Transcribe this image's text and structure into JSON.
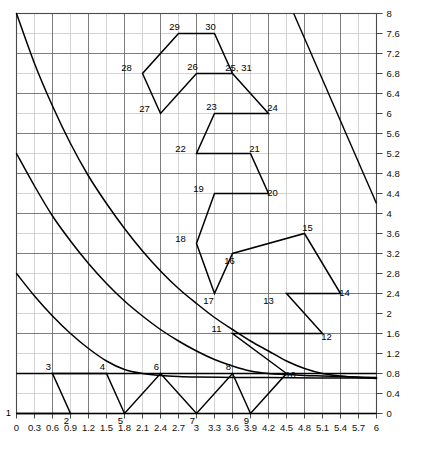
{
  "chart_data": {
    "type": "line",
    "title": "",
    "xlabel": "",
    "ylabel": "",
    "xlim": [
      0,
      6
    ],
    "ylim": [
      0,
      8
    ],
    "x_major_step": 0.3,
    "y_major_step": 0.4,
    "grid": true,
    "legend": null,
    "xticks": [
      "0",
      "0.3",
      "0.6",
      "0.9",
      "1.2",
      "1.5",
      "1.8",
      "2.1",
      "2.4",
      "2.7",
      "3",
      "3.3",
      "3.6",
      "3.9",
      "4.2",
      "4.5",
      "4.8",
      "5.1",
      "5.4",
      "5.7",
      "6"
    ],
    "yticks": [
      "0",
      "0.4",
      "0.8",
      "1.2",
      "1.6",
      "2",
      "2.4",
      "2.8",
      "3.2",
      "3.6",
      "4",
      "4.4",
      "4.8",
      "5.2",
      "5.6",
      "6",
      "6.4",
      "6.8",
      "7.2",
      "7.6",
      "8"
    ],
    "series": [
      {
        "name": "constraint-curve-1",
        "type": "curve",
        "points": [
          [
            0.0,
            8.0
          ],
          [
            0.3,
            7.0
          ],
          [
            0.6,
            6.15
          ],
          [
            0.9,
            5.4
          ],
          [
            1.2,
            4.75
          ],
          [
            1.5,
            4.2
          ],
          [
            1.8,
            3.7
          ],
          [
            2.1,
            3.25
          ],
          [
            2.4,
            2.85
          ],
          [
            2.7,
            2.5
          ],
          [
            3.0,
            2.2
          ],
          [
            3.3,
            1.92
          ],
          [
            3.6,
            1.68
          ],
          [
            3.9,
            1.45
          ],
          [
            4.2,
            1.25
          ],
          [
            4.5,
            1.05
          ],
          [
            4.8,
            0.9
          ],
          [
            5.1,
            0.8
          ],
          [
            5.4,
            0.75
          ],
          [
            5.7,
            0.72
          ],
          [
            6.0,
            0.7
          ]
        ]
      },
      {
        "name": "constraint-curve-2",
        "type": "curve",
        "points": [
          [
            0.0,
            5.2
          ],
          [
            0.3,
            4.55
          ],
          [
            0.6,
            3.95
          ],
          [
            0.9,
            3.45
          ],
          [
            1.2,
            3.0
          ],
          [
            1.5,
            2.6
          ],
          [
            1.8,
            2.25
          ],
          [
            2.1,
            1.95
          ],
          [
            2.4,
            1.68
          ],
          [
            2.7,
            1.45
          ],
          [
            3.0,
            1.25
          ],
          [
            3.3,
            1.08
          ],
          [
            3.6,
            0.95
          ],
          [
            3.9,
            0.85
          ],
          [
            4.2,
            0.8
          ],
          [
            4.5,
            0.78
          ],
          [
            4.8,
            0.76
          ],
          [
            5.1,
            0.75
          ],
          [
            5.4,
            0.74
          ],
          [
            5.7,
            0.73
          ],
          [
            6.0,
            0.72
          ]
        ]
      },
      {
        "name": "constraint-curve-3",
        "type": "curve",
        "points": [
          [
            0.0,
            2.8
          ],
          [
            0.3,
            2.35
          ],
          [
            0.6,
            1.95
          ],
          [
            0.9,
            1.6
          ],
          [
            1.2,
            1.3
          ],
          [
            1.5,
            1.05
          ],
          [
            1.8,
            0.88
          ],
          [
            2.1,
            0.8
          ],
          [
            2.4,
            0.76
          ],
          [
            2.7,
            0.74
          ],
          [
            3.0,
            0.73
          ],
          [
            3.6,
            0.72
          ],
          [
            4.2,
            0.72
          ],
          [
            5.0,
            0.71
          ],
          [
            6.0,
            0.71
          ]
        ]
      },
      {
        "name": "descending-line-right",
        "type": "line",
        "points": [
          [
            4.62,
            8.0
          ],
          [
            6.0,
            4.2
          ]
        ]
      },
      {
        "name": "baseline-horizontal-upper",
        "type": "line",
        "points": [
          [
            0.0,
            0.8
          ],
          [
            6.0,
            0.8
          ]
        ]
      },
      {
        "name": "baseline-horizontal-lower",
        "type": "line",
        "points": [
          [
            0.0,
            0.0
          ],
          [
            6.0,
            0.0
          ]
        ]
      },
      {
        "name": "simplex-path",
        "type": "polyline",
        "points": [
          [
            0.0,
            0.0
          ],
          [
            0.9,
            0.0
          ],
          [
            0.6,
            0.8
          ],
          [
            1.5,
            0.8
          ],
          [
            1.8,
            0.0
          ],
          [
            2.4,
            0.8
          ],
          [
            3.0,
            0.0
          ],
          [
            3.6,
            0.8
          ],
          [
            3.9,
            0.0
          ],
          [
            4.5,
            0.8
          ],
          [
            3.6,
            1.6
          ],
          [
            5.1,
            1.6
          ],
          [
            4.5,
            2.4
          ],
          [
            5.4,
            2.4
          ],
          [
            4.8,
            3.6
          ],
          [
            3.6,
            3.2
          ],
          [
            3.3,
            2.4
          ],
          [
            3.0,
            3.4
          ],
          [
            3.3,
            4.4
          ],
          [
            4.2,
            4.4
          ],
          [
            3.9,
            5.2
          ],
          [
            3.0,
            5.2
          ],
          [
            3.3,
            6.0
          ],
          [
            4.2,
            6.0
          ],
          [
            3.6,
            6.8
          ],
          [
            3.0,
            6.8
          ],
          [
            2.4,
            6.0
          ],
          [
            2.1,
            6.8
          ],
          [
            2.7,
            7.6
          ],
          [
            3.3,
            7.6
          ],
          [
            3.6,
            6.8
          ]
        ]
      }
    ],
    "vertex_labels": [
      {
        "id": "1",
        "x": 0.0,
        "y": 0.0,
        "dx": -8,
        "dy": 2
      },
      {
        "id": "2",
        "x": 0.9,
        "y": 0.0,
        "dx": -4,
        "dy": 10
      },
      {
        "id": "3",
        "x": 0.6,
        "y": 0.8,
        "dx": -4,
        "dy": -4
      },
      {
        "id": "4",
        "x": 1.5,
        "y": 0.8,
        "dx": -4,
        "dy": -4
      },
      {
        "id": "5",
        "x": 1.8,
        "y": 0.0,
        "dx": -4,
        "dy": 10
      },
      {
        "id": "6",
        "x": 2.4,
        "y": 0.8,
        "dx": -4,
        "dy": -4
      },
      {
        "id": "7",
        "x": 3.0,
        "y": 0.0,
        "dx": -4,
        "dy": 10
      },
      {
        "id": "8",
        "x": 3.6,
        "y": 0.8,
        "dx": -4,
        "dy": -4
      },
      {
        "id": "9",
        "x": 3.9,
        "y": 0.0,
        "dx": -4,
        "dy": 10
      },
      {
        "id": "10",
        "x": 4.5,
        "y": 0.8,
        "dx": 4,
        "dy": 4
      },
      {
        "id": "11",
        "x": 3.6,
        "y": 1.6,
        "dx": -16,
        "dy": -2
      },
      {
        "id": "12",
        "x": 5.1,
        "y": 1.6,
        "dx": 4,
        "dy": 6
      },
      {
        "id": "13",
        "x": 4.5,
        "y": 2.4,
        "dx": -18,
        "dy": 10
      },
      {
        "id": "14",
        "x": 5.4,
        "y": 2.4,
        "dx": 4,
        "dy": 2
      },
      {
        "id": "15",
        "x": 4.8,
        "y": 3.6,
        "dx": 3,
        "dy": -3
      },
      {
        "id": "16",
        "x": 3.6,
        "y": 3.2,
        "dx": -3,
        "dy": 10
      },
      {
        "id": "17",
        "x": 3.3,
        "y": 2.4,
        "dx": -6,
        "dy": 10
      },
      {
        "id": "18",
        "x": 3.0,
        "y": 3.4,
        "dx": -16,
        "dy": -2
      },
      {
        "id": "19",
        "x": 3.3,
        "y": 4.4,
        "dx": -16,
        "dy": -2
      },
      {
        "id": "20",
        "x": 4.2,
        "y": 4.4,
        "dx": 4,
        "dy": 2
      },
      {
        "id": "21",
        "x": 3.9,
        "y": 5.2,
        "dx": 4,
        "dy": -2
      },
      {
        "id": "22",
        "x": 3.0,
        "y": 5.2,
        "dx": -16,
        "dy": -2
      },
      {
        "id": "23",
        "x": 3.3,
        "y": 6.0,
        "dx": -3,
        "dy": -4
      },
      {
        "id": "24",
        "x": 4.2,
        "y": 6.0,
        "dx": 4,
        "dy": -3
      },
      {
        "id": "25, 31",
        "x": 3.6,
        "y": 6.8,
        "dx": 6,
        "dy": -3
      },
      {
        "id": "26",
        "x": 3.0,
        "y": 6.8,
        "dx": -4,
        "dy": -4
      },
      {
        "id": "27",
        "x": 2.4,
        "y": 6.0,
        "dx": -16,
        "dy": -2
      },
      {
        "id": "28",
        "x": 2.1,
        "y": 6.8,
        "dx": -16,
        "dy": -3
      },
      {
        "id": "29",
        "x": 2.7,
        "y": 7.6,
        "dx": -4,
        "dy": -4
      },
      {
        "id": "30",
        "x": 3.3,
        "y": 7.6,
        "dx": -4,
        "dy": -4
      }
    ],
    "colors": {
      "grid_minor": "#c8c8c8",
      "grid_major": "#6e6e6e",
      "curve": "#000000",
      "path": "#000000",
      "text": "#111111",
      "background": "#ffffff"
    }
  }
}
